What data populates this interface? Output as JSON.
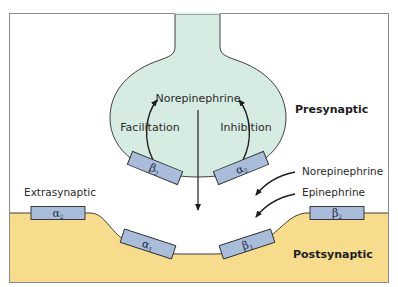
{
  "colors": {
    "presynaptic_fill": "#d6ebe2",
    "postsynaptic_fill": "#f6dc8c",
    "receptor_fill": "#a9bcd9",
    "stroke": "#2b2b2b",
    "frame": "#8a8a8a"
  },
  "labels": {
    "presynaptic": "Presynaptic",
    "postsynaptic": "Postsynaptic",
    "extrasynaptic": "Extrasynaptic",
    "norepinephrine_center": "Norepinephrine",
    "facilitation": "Facilitation",
    "inhibition": "Inhibition",
    "norepinephrine_right": "Norepinephrine",
    "epinephrine": "Epinephrine"
  },
  "receptors": [
    {
      "id": "pre-beta2",
      "symbol": "β",
      "sub": "2",
      "location": "presynaptic-left"
    },
    {
      "id": "pre-alpha2",
      "symbol": "α",
      "sub": "2",
      "location": "presynaptic-right"
    },
    {
      "id": "extra-alpha2",
      "symbol": "α",
      "sub": "2",
      "location": "extrasynaptic-left"
    },
    {
      "id": "post-alpha1",
      "symbol": "α",
      "sub": "1",
      "location": "postsynaptic-left"
    },
    {
      "id": "post-beta1",
      "symbol": "β",
      "sub": "1",
      "location": "postsynaptic-right"
    },
    {
      "id": "extra-beta2",
      "symbol": "β",
      "sub": "2",
      "location": "extrasynaptic-right"
    }
  ]
}
